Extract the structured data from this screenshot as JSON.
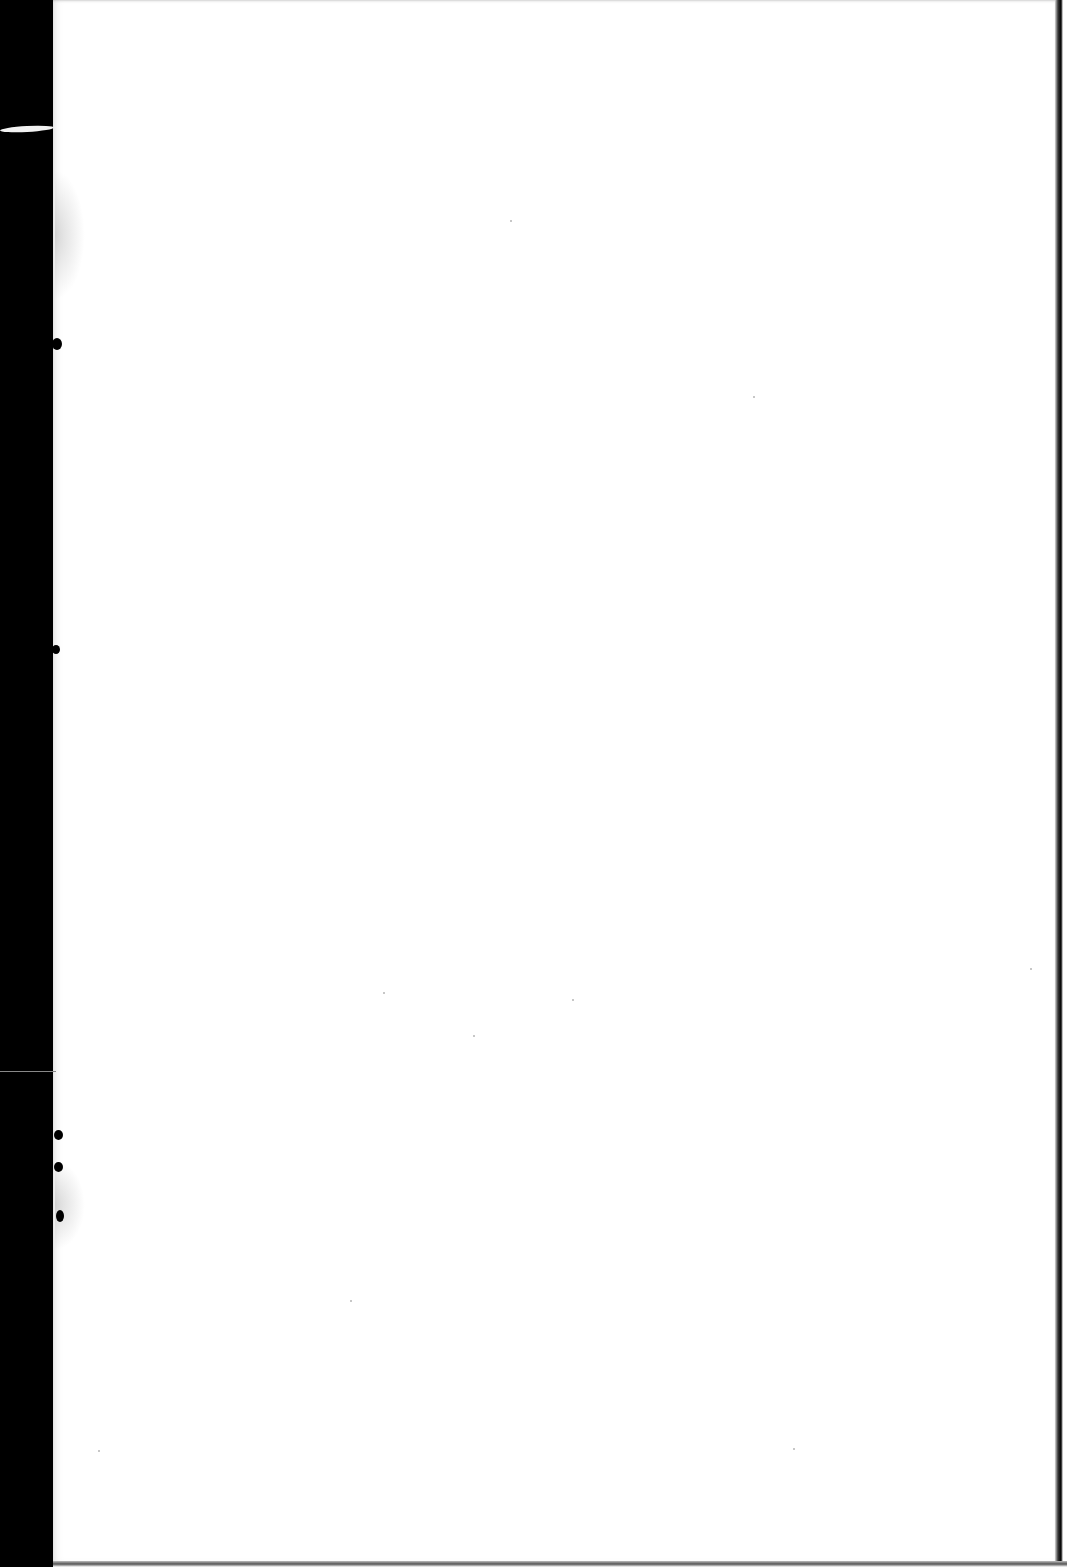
{
  "document": {
    "type": "scanned-page",
    "content_text": "",
    "is_blank": true
  },
  "colors": {
    "page": "#ffffff",
    "binding_margin": "#000000",
    "border": "#000000"
  }
}
